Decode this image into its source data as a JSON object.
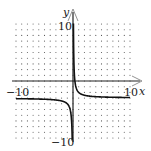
{
  "chart_data": {
    "type": "line",
    "title": "",
    "function": "y = 1/x - 3",
    "xlabel": "x",
    "ylabel": "y",
    "xlim": [
      -10,
      10
    ],
    "ylim": [
      -10,
      10
    ],
    "grid": "dotted",
    "tick_labels": {
      "x_min": "-10",
      "x_max": "10",
      "y_max": "10",
      "y_min": "-10"
    },
    "asymptotes": {
      "vertical": 0,
      "horizontal": -3
    },
    "series": [
      {
        "name": "right-branch",
        "x": [
          0.1,
          0.15,
          0.25,
          0.5,
          1,
          2,
          4,
          6,
          8,
          10
        ],
        "y": [
          7,
          3.67,
          1,
          -1,
          -2,
          -2.5,
          -2.75,
          -2.83,
          -2.88,
          -2.9
        ]
      },
      {
        "name": "left-branch",
        "x": [
          -10,
          -8,
          -6,
          -4,
          -2,
          -1,
          -0.5,
          -0.25,
          -0.15,
          -0.1
        ],
        "y": [
          -3.1,
          -3.13,
          -3.17,
          -3.25,
          -3.5,
          -4,
          -5,
          -7,
          -9.67,
          -13
        ]
      }
    ]
  },
  "labels": {
    "x_axis": "x",
    "y_axis": "y",
    "x_min": "−10",
    "x_max": "10",
    "y_max": "10",
    "y_min": "−10"
  },
  "colors": {
    "curve": "#111111",
    "axis": "#222222",
    "grid": "#555555"
  }
}
